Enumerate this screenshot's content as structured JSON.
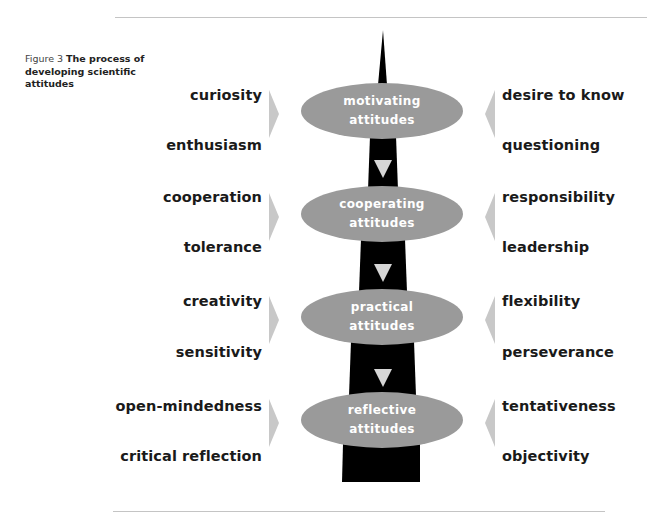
{
  "figure": {
    "label": "Figure 3",
    "title": "The process of developing scientific attitudes"
  },
  "stages": [
    {
      "line1": "motivating",
      "line2": "attitudes",
      "left": [
        "curiosity",
        "enthusiasm"
      ],
      "right": [
        "desire to know",
        "questioning"
      ]
    },
    {
      "line1": "cooperating",
      "line2": "attitudes",
      "left": [
        "cooperation",
        "tolerance"
      ],
      "right": [
        "responsibility",
        "leadership"
      ]
    },
    {
      "line1": "practical",
      "line2": "attitudes",
      "left": [
        "creativity",
        "sensitivity"
      ],
      "right": [
        "flexibility",
        "perseverance"
      ]
    },
    {
      "line1": "reflective",
      "line2": "attitudes",
      "left": [
        "open-mindedness",
        "critical reflection"
      ],
      "right": [
        "tentativeness",
        "objectivity"
      ]
    }
  ],
  "colors": {
    "ellipse": "#9a9a9a",
    "spine": "#000000",
    "arrow": "#c8c8c8",
    "down_arrow": "#d6d6d6"
  }
}
